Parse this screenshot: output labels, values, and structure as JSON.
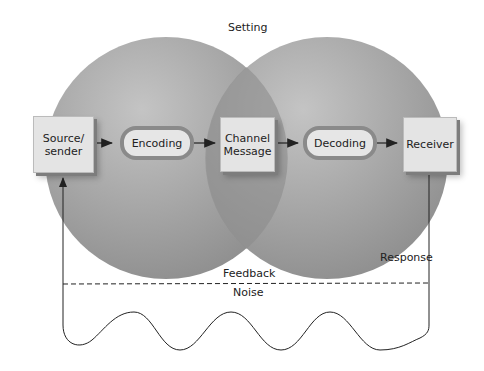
{
  "diagram": {
    "setting_label": "Setting",
    "nodes": {
      "source": {
        "line1": "Source/",
        "line2": "sender"
      },
      "encoding": "Encoding",
      "channel": {
        "line1": "Channel",
        "line2": "Message"
      },
      "decoding": "Decoding",
      "receiver": "Receiver"
    },
    "response_label": "Response",
    "feedback_label": "Feedback",
    "noise_label": "Noise",
    "colors": {
      "circle": "#9e9e9e",
      "overlap": "#8a8a8a",
      "box": "#e4e4e4",
      "line": "#222222"
    }
  }
}
